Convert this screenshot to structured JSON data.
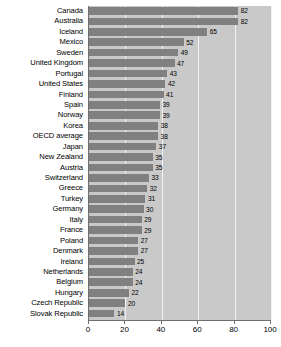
{
  "chart_data": {
    "type": "bar",
    "orientation": "horizontal",
    "title": "",
    "subtitle": "",
    "xlabel": "",
    "ylabel": "",
    "xlim": [
      0,
      100
    ],
    "xticks": [
      0,
      20,
      40,
      60,
      80,
      100
    ],
    "grid": true,
    "legend": false,
    "value_labels": true,
    "colors": {
      "bar": "#808080",
      "plot_background": "#c9c9c9",
      "gridline": "#f2f2f2",
      "axis": "#6e6e6e",
      "text": "#000000",
      "page_background": "#ffffff"
    },
    "categories": [
      "Canada",
      "Australia",
      "Iceland",
      "Mexico",
      "Sweden",
      "United Kingdom",
      "Portugal",
      "United States",
      "Finland",
      "Spain",
      "Norway",
      "Korea",
      "OECD average",
      "Japan",
      "New Zealand",
      "Austria",
      "Switzerland",
      "Greece",
      "Turkey",
      "Germany",
      "Italy",
      "France",
      "Poland",
      "Denmark",
      "Ireland",
      "Netherlands",
      "Belgium",
      "Hungary",
      "Czech Republic",
      "Slovak Republic"
    ],
    "values": [
      82,
      82,
      65,
      52,
      49,
      47,
      43,
      42,
      41,
      39,
      39,
      38,
      38,
      37,
      35,
      35,
      33,
      32,
      31,
      30,
      29,
      29,
      27,
      27,
      25,
      24,
      24,
      22,
      20,
      14
    ]
  }
}
